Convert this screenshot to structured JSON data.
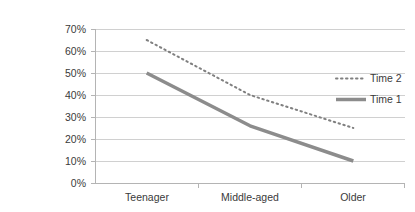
{
  "chart_data": {
    "type": "line",
    "title": "",
    "xlabel": "",
    "ylabel": "",
    "categories": [
      "Teenager",
      "Middle-aged",
      "Older"
    ],
    "series": [
      {
        "name": "Time 2",
        "values": [
          65,
          40,
          25
        ],
        "style": "dotted",
        "color": "#808080"
      },
      {
        "name": "Time 1",
        "values": [
          50,
          26,
          10
        ],
        "style": "solid",
        "color": "#8c8c8c"
      }
    ],
    "ylim": [
      0,
      70
    ],
    "ytick_values": [
      0,
      10,
      20,
      30,
      40,
      50,
      60,
      70
    ],
    "ytick_labels": [
      "0%",
      "10%",
      "20%",
      "30%",
      "40%",
      "50%",
      "60%",
      "70%"
    ],
    "grid": true,
    "legend_position": "right"
  },
  "axes": {
    "y_labels": [
      "70%",
      "60%",
      "50%",
      "40%",
      "30%",
      "20%",
      "10%",
      "0%"
    ],
    "x_labels": [
      "Teenager",
      "Middle-aged",
      "Older"
    ]
  },
  "legend": {
    "items": [
      {
        "label": "Time 2",
        "marker": "dotted-line-swatch"
      },
      {
        "label": "Time 1",
        "marker": "solid-line-swatch"
      }
    ]
  },
  "colors": {
    "series_time2": "#808080",
    "series_time1": "#8c8c8c",
    "gridline": "#d0d0d0",
    "axis": "#b4b4b4",
    "text": "#3a3a3a",
    "background": "#ffffff"
  }
}
